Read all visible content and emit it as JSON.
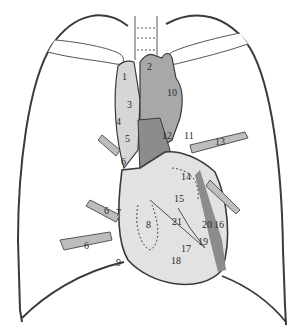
{
  "figure": {
    "type": "anatomical diagram",
    "colors": {
      "background": "#ffffff",
      "outline": "#3a3a3a",
      "heart_fill": "#e2e2e2",
      "vessel_dark": "#8c8c8c",
      "vessel_mid": "#a8a8a8",
      "vessel_light": "#d6d6d6"
    }
  },
  "labels": [
    {
      "id": "1",
      "text": "1",
      "x": 122,
      "y": 72
    },
    {
      "id": "2",
      "text": "2",
      "x": 147,
      "y": 62
    },
    {
      "id": "3",
      "text": "3",
      "x": 127,
      "y": 100
    },
    {
      "id": "10",
      "text": "10",
      "x": 167,
      "y": 88
    },
    {
      "id": "4",
      "text": "4",
      "x": 116,
      "y": 117
    },
    {
      "id": "5",
      "text": "5",
      "x": 125,
      "y": 134
    },
    {
      "id": "6a",
      "text": "6",
      "x": 121,
      "y": 157
    },
    {
      "id": "12",
      "text": "12",
      "x": 162,
      "y": 131
    },
    {
      "id": "11",
      "text": "11",
      "x": 184,
      "y": 131
    },
    {
      "id": "13",
      "text": "13",
      "x": 215,
      "y": 137
    },
    {
      "id": "14",
      "text": "14",
      "x": 181,
      "y": 172
    },
    {
      "id": "15",
      "text": "15",
      "x": 174,
      "y": 194
    },
    {
      "id": "6b",
      "text": "6",
      "x": 104,
      "y": 206
    },
    {
      "id": "7",
      "text": "7",
      "x": 116,
      "y": 208
    },
    {
      "id": "21",
      "text": "21",
      "x": 172,
      "y": 217
    },
    {
      "id": "20",
      "text": "20",
      "x": 202,
      "y": 220
    },
    {
      "id": "16",
      "text": "16",
      "x": 214,
      "y": 220
    },
    {
      "id": "8",
      "text": "8",
      "x": 146,
      "y": 220
    },
    {
      "id": "19",
      "text": "19",
      "x": 198,
      "y": 237
    },
    {
      "id": "6c",
      "text": "6",
      "x": 84,
      "y": 241
    },
    {
      "id": "17",
      "text": "17",
      "x": 181,
      "y": 244
    },
    {
      "id": "18",
      "text": "18",
      "x": 171,
      "y": 256
    },
    {
      "id": "9",
      "text": "9",
      "x": 116,
      "y": 258
    }
  ]
}
